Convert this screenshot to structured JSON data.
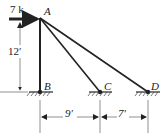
{
  "diagram": {
    "type": "truss",
    "nodes": {
      "A": {
        "label": "A"
      },
      "B": {
        "label": "B"
      },
      "C": {
        "label": "C"
      },
      "D": {
        "label": "D"
      }
    },
    "members": [
      "AB",
      "AC",
      "AD"
    ],
    "load": {
      "label": "7 k",
      "at": "A",
      "direction": "right"
    },
    "dimensions": {
      "height": "12′",
      "bc": "9′",
      "cd": "7′"
    },
    "supports": [
      "B",
      "C",
      "D"
    ]
  }
}
